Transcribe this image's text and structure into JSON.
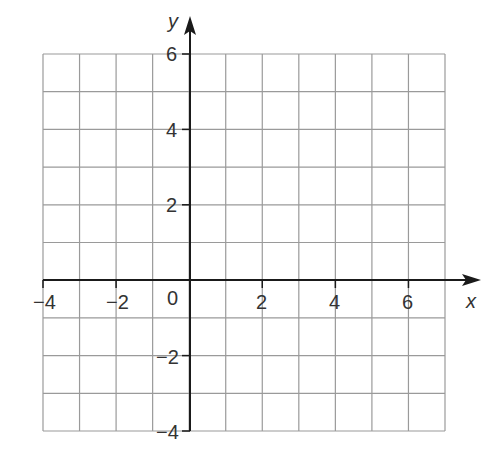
{
  "chart_data": {
    "type": "grid",
    "title": "",
    "xlabel": "x",
    "ylabel": "y",
    "xlim": [
      -4,
      7
    ],
    "ylim": [
      -4,
      6
    ],
    "grid": true,
    "grid_step": 1,
    "x_tick_labels": [
      "-4",
      "-2",
      "2",
      "4",
      "6"
    ],
    "x_tick_values": [
      -4,
      -2,
      2,
      4,
      6
    ],
    "y_tick_labels": [
      "6",
      "4",
      "2",
      "-2",
      "-4"
    ],
    "y_tick_values": [
      6,
      4,
      2,
      -2,
      -4
    ],
    "origin_label": "0",
    "series": []
  },
  "labels": {
    "x_axis": "x",
    "y_axis": "y",
    "origin": "0",
    "x_ticks": [
      "−4",
      "−2",
      "2",
      "4",
      "6"
    ],
    "y_ticks": [
      "6",
      "4",
      "2",
      "−2",
      "−4"
    ]
  },
  "colors": {
    "grid": "#9a9a9a",
    "axis": "#1a1a1a",
    "text": "#333333"
  }
}
